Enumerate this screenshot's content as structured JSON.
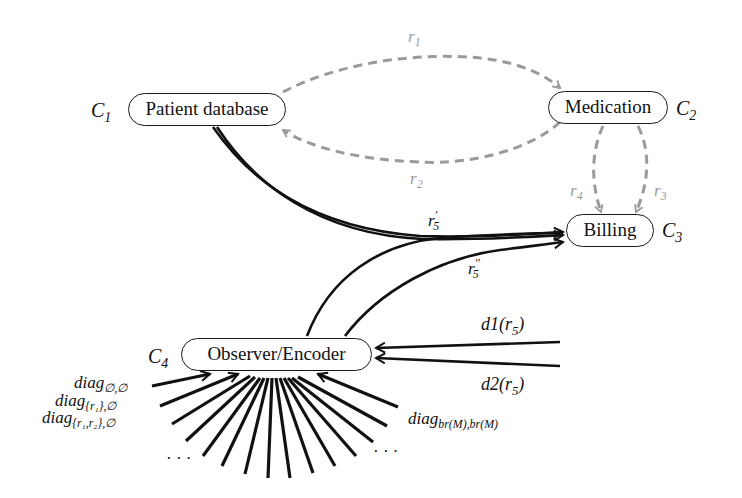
{
  "nodes": {
    "c1": {
      "id": "C",
      "sub": "1",
      "label": "Patient database"
    },
    "c2": {
      "id": "C",
      "sub": "2",
      "label": "Medication"
    },
    "c3": {
      "id": "C",
      "sub": "3",
      "label": "Billing"
    },
    "c4": {
      "id": "C",
      "sub": "4",
      "label": "Observer/Encoder"
    }
  },
  "edges": {
    "r1": {
      "base": "r",
      "sub": "1",
      "style": "dashed",
      "color": "#9a9a9a",
      "from": "Patient database",
      "to": "Medication"
    },
    "r2": {
      "base": "r",
      "sub": "2",
      "style": "dashed",
      "color": "#9a9a9a",
      "from": "Medication",
      "to": "Patient database"
    },
    "r3": {
      "base": "r",
      "sub": "3",
      "style": "dashed",
      "color": "#9a9a9a",
      "from": "Medication",
      "to": "Billing"
    },
    "r4": {
      "base": "r",
      "sub": "4",
      "style": "dashed",
      "color": "#9a9a9a",
      "from": "Medication",
      "to": "Billing"
    },
    "r5p": {
      "base": "r",
      "sub": "5",
      "sup": "′",
      "style": "solid",
      "color": "#111111",
      "from": "Patient database",
      "to": "Billing"
    },
    "r5pp": {
      "base": "r",
      "sub": "5",
      "sup": "′′",
      "style": "solid",
      "color": "#111111",
      "from": "Observer/Encoder",
      "to": "Billing"
    },
    "d1": {
      "base": "d1(r",
      "sub": "5",
      "tail": ")",
      "to": "Observer/Encoder"
    },
    "d2": {
      "base": "d2(r",
      "sub": "5",
      "tail": ")",
      "to": "Observer/Encoder"
    }
  },
  "diag_labels": {
    "d00": {
      "base": "diag",
      "sub": "∅,∅"
    },
    "d10": {
      "base": "diag",
      "sub": "{r₁},∅"
    },
    "d120": {
      "base": "diag",
      "sub": "{r₁,r₂},∅"
    },
    "dbr": {
      "base": "diag",
      "sub": "br(M),br(M)"
    },
    "ellipsis_left": "· · ·",
    "ellipsis_right": "· · ·"
  }
}
